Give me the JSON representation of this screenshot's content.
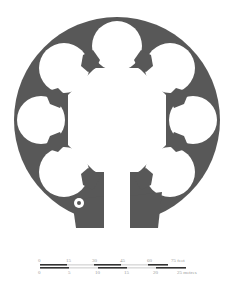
{
  "diagram": {
    "type": "architectural-floor-plan",
    "colors": {
      "wall": "#585858",
      "background": "#ffffff",
      "guide": "#e6e6e6",
      "scale_dark": "#333333",
      "scale_light": "#dddddd",
      "label": "#9a9a9a"
    }
  },
  "scale_bar": {
    "feet": {
      "ticks": [
        "0",
        "15",
        "30",
        "45",
        "60"
      ],
      "end_label": "75 feet"
    },
    "metres": {
      "ticks": [
        "0",
        "5",
        "10",
        "15",
        "20"
      ],
      "end_label": "25 metres"
    }
  }
}
